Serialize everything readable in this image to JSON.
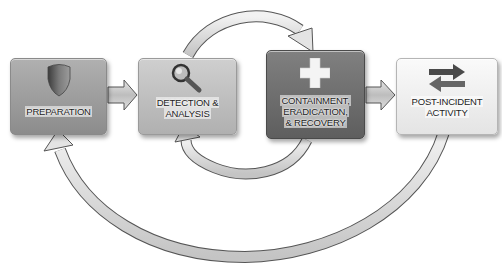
{
  "diagram": {
    "type": "process-cycle",
    "phases": [
      {
        "id": "preparation",
        "label_lines": [
          "PREPARATION"
        ],
        "icon": "shield-icon",
        "fill": "#9a9a9a"
      },
      {
        "id": "detection",
        "label_lines": [
          "DETECTION &",
          "ANALYSIS"
        ],
        "icon": "magnifier-icon",
        "fill": "#b9b9b9"
      },
      {
        "id": "containment",
        "label_lines": [
          "CONTAINMENT,",
          "ERADICATION,",
          "& RECOVERY"
        ],
        "icon": "cross-icon",
        "fill": "#6e6e6e"
      },
      {
        "id": "post-incident",
        "label_lines": [
          "POST-INCIDENT",
          "ACTIVITY"
        ],
        "icon": "swap-arrows-icon",
        "fill": "#e8e8e8"
      }
    ],
    "connections": [
      {
        "from": "preparation",
        "to": "detection",
        "style": "straight-arrow"
      },
      {
        "from": "detection",
        "to": "containment",
        "style": "top-arc-arrow"
      },
      {
        "from": "containment",
        "to": "detection",
        "style": "lower-arc-arrow"
      },
      {
        "from": "containment",
        "to": "post-incident",
        "style": "straight-arrow"
      },
      {
        "from": "post-incident",
        "to": "preparation",
        "style": "bottom-arc-arrow"
      }
    ]
  }
}
